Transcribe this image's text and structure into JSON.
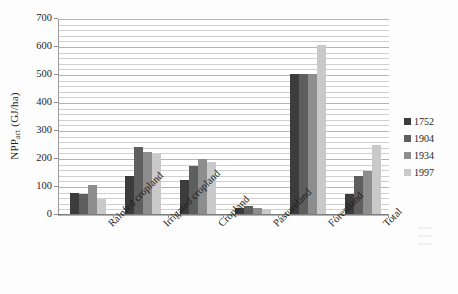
{
  "chart_data": {
    "type": "bar",
    "title": "",
    "xlabel": "",
    "ylabel": "NPP",
    "ylabel_sub": "act",
    "ylabel_unit": " (GJ/ha)",
    "ylim": [
      0,
      700
    ],
    "ytick_values": [
      0,
      100,
      200,
      300,
      400,
      500,
      600,
      700
    ],
    "ytick_labels": [
      "0",
      "100",
      "200",
      "300",
      "400",
      "500",
      "600",
      "700"
    ],
    "minor_gridlines_per_major": 4,
    "grid": true,
    "legend_position": "right",
    "categories": [
      "Rainfed cropland",
      "Irrigated cropland",
      "Cropland",
      "Pastureland",
      "Forestland",
      "Total"
    ],
    "series": [
      {
        "name": "1752",
        "color": "#3c3c3c",
        "values": [
          75,
          135,
          120,
          22,
          500,
          70
        ]
      },
      {
        "name": "1904",
        "color": "#5e5e5e",
        "values": [
          70,
          240,
          170,
          28,
          500,
          135
        ]
      },
      {
        "name": "1934",
        "color": "#8d8d8d",
        "values": [
          105,
          220,
          195,
          22,
          500,
          155
        ]
      },
      {
        "name": "1997",
        "color": "#c9c9c9",
        "values": [
          55,
          215,
          185,
          18,
          605,
          245
        ]
      }
    ]
  }
}
